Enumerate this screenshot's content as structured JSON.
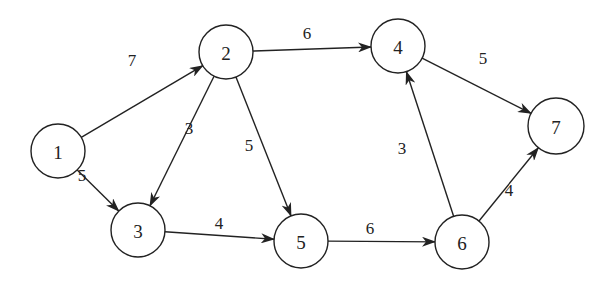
{
  "diagram": {
    "type": "directed-weighted-graph",
    "nodes": [
      {
        "id": "1",
        "label": "1",
        "x": 58,
        "y": 151,
        "r": 27
      },
      {
        "id": "2",
        "label": "2",
        "x": 226,
        "y": 52,
        "r": 27
      },
      {
        "id": "3",
        "label": "3",
        "x": 138,
        "y": 230,
        "r": 27
      },
      {
        "id": "4",
        "label": "4",
        "x": 398,
        "y": 46,
        "r": 27
      },
      {
        "id": "5",
        "label": "5",
        "x": 301,
        "y": 241,
        "r": 27
      },
      {
        "id": "6",
        "label": "6",
        "x": 462,
        "y": 242,
        "r": 27
      },
      {
        "id": "7",
        "label": "7",
        "x": 556,
        "y": 126,
        "r": 28
      }
    ],
    "edges": [
      {
        "from": "1",
        "to": "2",
        "weight": "7",
        "label_x": 132,
        "label_y": 60
      },
      {
        "from": "1",
        "to": "3",
        "weight": "5",
        "label_x": 82,
        "label_y": 175
      },
      {
        "from": "2",
        "to": "3",
        "weight": "3",
        "label_x": 189,
        "label_y": 128
      },
      {
        "from": "2",
        "to": "5",
        "weight": "5",
        "label_x": 249,
        "label_y": 145
      },
      {
        "from": "2",
        "to": "4",
        "weight": "6",
        "label_x": 307,
        "label_y": 33
      },
      {
        "from": "3",
        "to": "5",
        "weight": "4",
        "label_x": 219,
        "label_y": 223
      },
      {
        "from": "5",
        "to": "6",
        "weight": "6",
        "label_x": 370,
        "label_y": 228
      },
      {
        "from": "6",
        "to": "4",
        "weight": "3",
        "label_x": 402,
        "label_y": 148
      },
      {
        "from": "4",
        "to": "7",
        "weight": "5",
        "label_x": 483,
        "label_y": 58
      },
      {
        "from": "6",
        "to": "7",
        "weight": "4",
        "label_x": 509,
        "label_y": 190
      }
    ],
    "colors": {
      "stroke": "#222222",
      "background": "#ffffff"
    }
  }
}
